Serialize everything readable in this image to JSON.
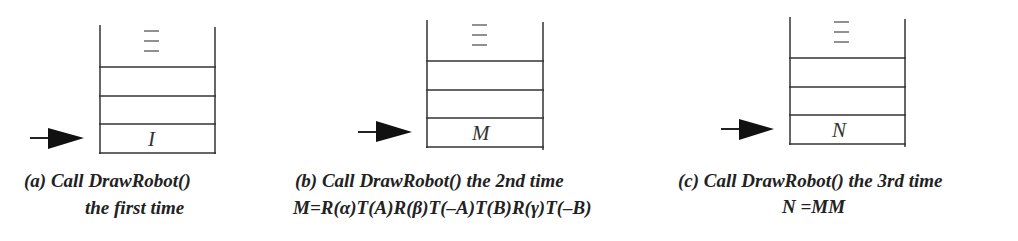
{
  "panels": [
    {
      "id": "a",
      "cell_label": "I",
      "caption_line1": "(a) Call DrawRobot()",
      "caption_line2": "the first time"
    },
    {
      "id": "b",
      "cell_label": "M",
      "caption_line1": "(b) Call DrawRobot() the 2nd time",
      "caption_line2": "M=R(α)T(A)R(β)T(–A)T(B)R(γ)T(–B)"
    },
    {
      "id": "c",
      "cell_label": "N",
      "caption_line1": "(c) Call DrawRobot() the 3rd time",
      "caption_line2": "N =MM"
    }
  ],
  "ellipsis_icon": "vertical-ellipsis (three stacked dashes)",
  "arrow_icon": "right-pointing filled arrow",
  "colors": {
    "line": "#333333",
    "background": "#ffffff"
  }
}
